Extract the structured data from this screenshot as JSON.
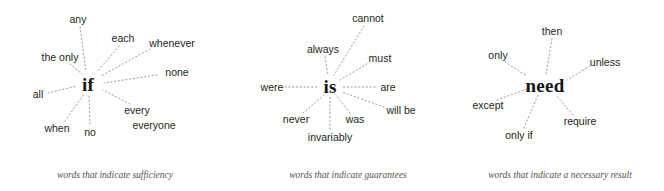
{
  "figure": {
    "background": "#ffffff",
    "text_color": "#231f20",
    "hub_color": "#151515",
    "caption_color": "#555152",
    "spoke_color": "#8b8b8b"
  },
  "clusters": [
    {
      "id": "sufficiency",
      "hub": {
        "label": "if",
        "x": 88,
        "y": 84
      },
      "caption": {
        "label": "words that indicate sufficiency",
        "x": 115,
        "y": 177
      },
      "nodes": [
        {
          "label": "any",
          "x": 78,
          "y": 19,
          "ax": 80,
          "ay": 27,
          "bx": 86,
          "by": 72
        },
        {
          "label": "each",
          "x": 123,
          "y": 38,
          "ax": 119,
          "ay": 46,
          "bx": 97,
          "by": 72
        },
        {
          "label": "whenever",
          "x": 172,
          "y": 43,
          "ax": 150,
          "ay": 49,
          "bx": 101,
          "by": 76
        },
        {
          "label": "the only",
          "x": 60,
          "y": 57,
          "ax": 70,
          "ay": 64,
          "bx": 82,
          "by": 74
        },
        {
          "label": "none",
          "x": 177,
          "y": 72,
          "ax": 157,
          "ay": 75,
          "bx": 104,
          "by": 83
        },
        {
          "label": "all",
          "x": 38,
          "y": 94,
          "ax": 48,
          "ay": 93,
          "bx": 77,
          "by": 86
        },
        {
          "label": "every",
          "x": 137,
          "y": 110,
          "ax": 130,
          "ay": 104,
          "bx": 103,
          "by": 90
        },
        {
          "label": "everyone",
          "x": 154,
          "y": 125,
          "ax": 154,
          "ay": 125,
          "bx": 154,
          "by": 125
        },
        {
          "label": "when",
          "x": 57,
          "y": 128,
          "ax": 65,
          "ay": 121,
          "bx": 84,
          "by": 94
        },
        {
          "label": "no",
          "x": 90,
          "y": 132,
          "ax": 90,
          "ay": 124,
          "bx": 89,
          "by": 95
        }
      ]
    },
    {
      "id": "guarantees",
      "hub": {
        "label": "is",
        "x": 330,
        "y": 86
      },
      "caption": {
        "label": "words that indicate guarantees",
        "x": 348,
        "y": 177
      },
      "nodes": [
        {
          "label": "cannot",
          "x": 368,
          "y": 18,
          "ax": 364,
          "ay": 26,
          "bx": 334,
          "by": 75
        },
        {
          "label": "always",
          "x": 323,
          "y": 49,
          "ax": 325,
          "ay": 57,
          "bx": 328,
          "by": 75
        },
        {
          "label": "must",
          "x": 380,
          "y": 58,
          "ax": 367,
          "ay": 64,
          "bx": 340,
          "by": 80
        },
        {
          "label": "were",
          "x": 272,
          "y": 87,
          "ax": 285,
          "ay": 87,
          "bx": 318,
          "by": 87
        },
        {
          "label": "are",
          "x": 388,
          "y": 87,
          "ax": 375,
          "ay": 87,
          "bx": 343,
          "by": 87
        },
        {
          "label": "will be",
          "x": 401,
          "y": 110,
          "ax": 384,
          "ay": 107,
          "bx": 342,
          "by": 92
        },
        {
          "label": "never",
          "x": 296,
          "y": 119,
          "ax": 303,
          "ay": 113,
          "bx": 324,
          "by": 95
        },
        {
          "label": "was",
          "x": 355,
          "y": 119,
          "ax": 350,
          "ay": 113,
          "bx": 336,
          "by": 95
        },
        {
          "label": "invariably",
          "x": 330,
          "y": 137,
          "ax": 330,
          "ay": 129,
          "bx": 330,
          "by": 96
        }
      ]
    },
    {
      "id": "necessary-result",
      "hub": {
        "label": "need",
        "x": 545,
        "y": 85
      },
      "caption": {
        "label": "words that indicate a necessary result",
        "x": 560,
        "y": 177
      },
      "nodes": [
        {
          "label": "then",
          "x": 552,
          "y": 31,
          "ax": 552,
          "ay": 39,
          "bx": 546,
          "by": 74
        },
        {
          "label": "only",
          "x": 498,
          "y": 55,
          "ax": 505,
          "ay": 62,
          "bx": 527,
          "by": 76
        },
        {
          "label": "unless",
          "x": 605,
          "y": 62,
          "ax": 590,
          "ay": 66,
          "bx": 567,
          "by": 80
        },
        {
          "label": "except",
          "x": 488,
          "y": 105,
          "ax": 497,
          "ay": 100,
          "bx": 527,
          "by": 89
        },
        {
          "label": "require",
          "x": 580,
          "y": 121,
          "ax": 573,
          "ay": 115,
          "bx": 556,
          "by": 95
        },
        {
          "label": "only if",
          "x": 519,
          "y": 135,
          "ax": 524,
          "ay": 128,
          "bx": 538,
          "by": 95
        }
      ]
    }
  ]
}
